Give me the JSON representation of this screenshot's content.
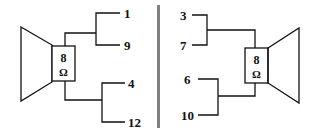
{
  "diagram": {
    "title": "",
    "divider_color": "#808080",
    "line_color": "#111111",
    "left_speaker": {
      "impedance_value": "8",
      "impedance_unit": "Ω",
      "terminals": [
        {
          "label": "1"
        },
        {
          "label": "9"
        },
        {
          "label": "4"
        },
        {
          "label": "12"
        }
      ]
    },
    "right_speaker": {
      "impedance_value": "8",
      "impedance_unit": "Ω",
      "terminals": [
        {
          "label": "3"
        },
        {
          "label": "7"
        },
        {
          "label": "6"
        },
        {
          "label": "10"
        }
      ]
    }
  }
}
